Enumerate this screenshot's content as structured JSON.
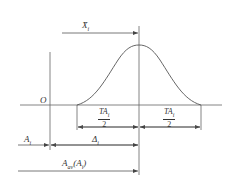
{
  "diagram": {
    "type": "tolerance-distribution",
    "labels": {
      "mean": "X̄",
      "mean_sub": "i",
      "origin": "O",
      "half_tol_left_num": "TA",
      "half_tol_left_sub": "i",
      "half_tol_left_den": "2",
      "half_tol_right_num": "TA",
      "half_tol_right_sub": "i",
      "half_tol_right_den": "2",
      "a_i": "A",
      "a_i_sub": "i",
      "delta_i": "Δ",
      "delta_i_sub": "i",
      "a_av": "A",
      "a_av_sub": "av",
      "a_av_paren": "(A",
      "a_av_paren_sub": "i",
      "a_av_close": ")"
    },
    "colors": {
      "line": "#555555",
      "text": "#333333",
      "background": "#ffffff"
    }
  }
}
